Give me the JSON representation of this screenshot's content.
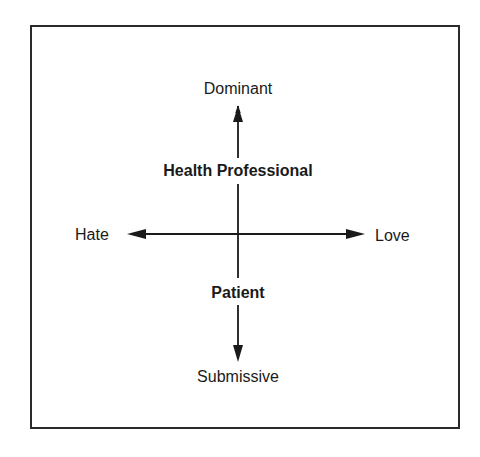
{
  "diagram": {
    "type": "two-axis interpersonal circumplex",
    "axes": {
      "vertical": {
        "top_label": "Dominant",
        "bottom_label": "Submissive"
      },
      "horizontal": {
        "left_label": "Hate",
        "right_label": "Love"
      }
    },
    "positions": {
      "upper": "Health Professional",
      "lower": "Patient"
    },
    "colors": {
      "ink": "#1a1a1a",
      "frame": "#2a2a2a",
      "background": "#ffffff"
    }
  }
}
